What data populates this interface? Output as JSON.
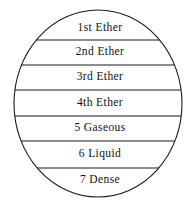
{
  "figure": {
    "shape": "circle",
    "title": "",
    "stroke_color": "#1a1a1a",
    "fill_color": "#ffffff",
    "text_color": "#111111",
    "circle": {
      "center_x": 98,
      "center_y": 103.5,
      "radius_x": 84,
      "radius_y": 93.5
    }
  },
  "bands": [
    {
      "label": "1st Ether",
      "index": 1,
      "divider_y": 40,
      "text_y": 28
    },
    {
      "label": "2nd Ether",
      "index": 2,
      "divider_y": 65,
      "text_y": 52
    },
    {
      "label": "3rd Ether",
      "index": 3,
      "divider_y": 90,
      "text_y": 77
    },
    {
      "label": "4th Ether",
      "index": 4,
      "divider_y": 116,
      "text_y": 103
    },
    {
      "label": "5 Gaseous",
      "index": 5,
      "divider_y": 141,
      "text_y": 128
    },
    {
      "label": "6 Liquid",
      "index": 6,
      "divider_y": 168,
      "text_y": 154
    },
    {
      "label": "7 Dense",
      "index": 7,
      "divider_y": null,
      "text_y": 180
    }
  ]
}
